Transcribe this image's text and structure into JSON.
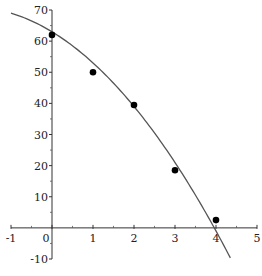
{
  "chart_data": {
    "type": "scatter",
    "title": "",
    "xlabel": "",
    "ylabel": "",
    "xlim": [
      -1,
      5
    ],
    "ylim": [
      -10,
      70
    ],
    "xticks": [
      -1,
      0,
      1,
      2,
      3,
      4,
      5
    ],
    "yticks": [
      -10,
      10,
      20,
      30,
      40,
      50,
      60,
      70
    ],
    "xtick_labels": [
      "-1",
      "0",
      "1",
      "2",
      "3",
      "4",
      "5"
    ],
    "ytick_labels": [
      "-10",
      "10",
      "20",
      "30",
      "40",
      "50",
      "60",
      "70"
    ],
    "grid": false,
    "legend": "none",
    "series": [
      {
        "name": "data points",
        "kind": "scatter",
        "color": "#000000",
        "x": [
          0,
          1,
          2,
          3,
          4
        ],
        "y": [
          62,
          50,
          39.5,
          18.5,
          2.5
        ]
      },
      {
        "name": "fitted curve",
        "kind": "line",
        "color": "#555555",
        "model": "quadratic",
        "coefficients": {
          "a": 63,
          "b": -8,
          "c": -2
        },
        "x_range": [
          -1,
          4.35
        ]
      }
    ]
  }
}
